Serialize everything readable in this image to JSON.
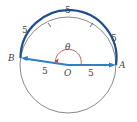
{
  "diagram": {
    "type": "circle-arc-angle",
    "colors": {
      "arc": "#1f4e8c",
      "radius": "#2f7ec8",
      "angle": "#c0392b",
      "circle": "#555555",
      "text": "#444444"
    },
    "points": {
      "A": "A",
      "B": "B",
      "O": "O"
    },
    "angle_label": "θ",
    "radius_labels": [
      "5",
      "5"
    ],
    "arc_segment_labels": [
      "5",
      "5",
      "5",
      "5"
    ]
  }
}
